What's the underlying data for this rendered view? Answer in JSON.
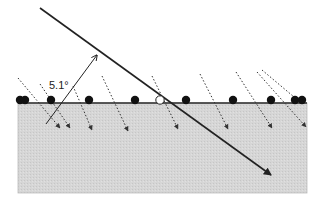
{
  "diagram": {
    "angle_label": "5.1°",
    "colors": {
      "background": "#ffffff",
      "medium_fill": "#d4d4d4",
      "surface_line": "#2a2a2a",
      "main_ray": "#222222",
      "dotted_ray": "#333333",
      "atom_filled": "#111111",
      "atom_open_fill": "#ffffff"
    },
    "medium_block": {
      "x": 18,
      "y": 103,
      "width": 289,
      "height": 90
    },
    "surface_y": 103,
    "main_ray": {
      "x1": 40,
      "y1": 8,
      "x2": 271,
      "y2": 175
    },
    "normal_arrow": {
      "x1": 46,
      "y1": 124,
      "x2": 97,
      "y2": 55
    },
    "atoms_filled_x": [
      20,
      25,
      51,
      89,
      135,
      186,
      233,
      271,
      295,
      302
    ],
    "atom_open_x": 160,
    "dotted_rays": [
      {
        "x1": 18,
        "y1": 78,
        "x2": 60,
        "y2": 128
      },
      {
        "x1": 40,
        "y1": 84,
        "x2": 70,
        "y2": 128
      },
      {
        "x1": 73,
        "y1": 86,
        "x2": 92,
        "y2": 130
      },
      {
        "x1": 102,
        "y1": 76,
        "x2": 128,
        "y2": 131
      },
      {
        "x1": 152,
        "y1": 76,
        "x2": 178,
        "y2": 129
      },
      {
        "x1": 200,
        "y1": 74,
        "x2": 228,
        "y2": 129
      },
      {
        "x1": 236,
        "y1": 72,
        "x2": 272,
        "y2": 128
      },
      {
        "x1": 257,
        "y1": 72,
        "x2": 306,
        "y2": 127
      },
      {
        "x1": 262,
        "y1": 70,
        "x2": 300,
        "y2": 102
      }
    ]
  }
}
